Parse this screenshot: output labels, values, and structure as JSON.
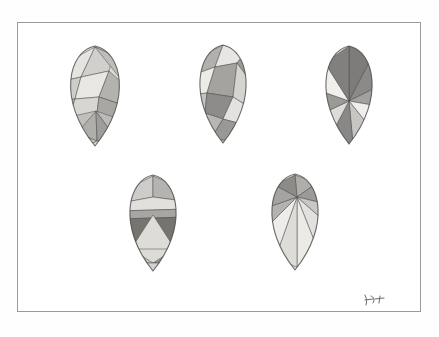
{
  "artwork": {
    "title": "Faceted Eggs Study",
    "medium": "watercolour and graphite on paper",
    "palette": {
      "paper": "#fefefe",
      "frame_line": "#9a9a99",
      "ink_line": "#4a4a4a",
      "tone_lightest": "#efeeec",
      "tone_light": "#dddbd8",
      "tone_mid_light": "#c6c4c1",
      "tone_mid": "#adaba8",
      "tone_mid_dark": "#949290",
      "tone_dark": "#7d7b79",
      "tone_darkest": "#6a6866"
    },
    "frame": {
      "x": 17,
      "y": 22,
      "width": 404,
      "height": 290
    },
    "signature": {
      "label": "artist-signature",
      "text": ""
    },
    "layout": {
      "top_row_count": 3,
      "bottom_row_count": 2,
      "total": 5
    },
    "eggs": [
      {
        "name": "egg-top-left",
        "pattern": "irregular-triangulation",
        "cx": 94,
        "cy": 95,
        "rx": 38,
        "ry": 50,
        "facets": [
          {
            "points": "94,46 72,58 62,80 80,76",
            "tone": "#e6e4e1"
          },
          {
            "points": "94,46 80,76 108,70 112,54",
            "tone": "#d2d0cd"
          },
          {
            "points": "94,46 112,54 124,72 126,86",
            "tone": "#bfbdba"
          },
          {
            "points": "62,80 80,76 74,98 60,100",
            "tone": "#cfcdca"
          },
          {
            "points": "80,76 108,70 98,96 74,98",
            "tone": "#e9e7e4"
          },
          {
            "points": "108,70 126,86 122,104 98,96",
            "tone": "#b4b2af"
          },
          {
            "points": "60,100 74,98 68,116 58,112",
            "tone": "#bdbbb8"
          },
          {
            "points": "74,98 98,96 96,112 68,116",
            "tone": "#d8d6d3"
          },
          {
            "points": "98,96 122,104 124,120 96,112",
            "tone": "#a9a7a4"
          },
          {
            "points": "96,112 95,110 68,116 76,132",
            "tone": "#c2c0bd"
          },
          {
            "points": "95,110 76,132 96,140",
            "tone": "#b0aeab"
          },
          {
            "points": "95,110 96,140 114,136",
            "tone": "#9f9d9a"
          },
          {
            "points": "95,110 114,136 124,120",
            "tone": "#bcbab7"
          },
          {
            "points": "58,112 68,116 76,132 62,128",
            "tone": "#d5d3d0"
          },
          {
            "points": "62,128 76,132 96,140 84,146",
            "tone": "#cac8c5"
          },
          {
            "points": "96,140 114,136 124,120 128,132 112,146 84,146",
            "tone": "#ddd9d6"
          }
        ]
      },
      {
        "name": "egg-top-center",
        "pattern": "bold-angular-planes",
        "cx": 222,
        "cy": 93,
        "rx": 36,
        "ry": 49,
        "facets": [
          {
            "points": "222,44 198,56 192,74 214,66",
            "tone": "#b2b0ad"
          },
          {
            "points": "222,44 214,66 236,62 244,52",
            "tone": "#e8e6e3"
          },
          {
            "points": "244,52 236,62 252,84 256,72",
            "tone": "#9e9c99"
          },
          {
            "points": "192,74 214,66 206,92 190,94",
            "tone": "#edebe8"
          },
          {
            "points": "214,66 236,62 232,96 206,92",
            "tone": "#a5a3a0"
          },
          {
            "points": "236,62 252,84 248,106 232,96",
            "tone": "#d6d4d1"
          },
          {
            "points": "190,94 206,92 204,112 188,110",
            "tone": "#c4c2bf"
          },
          {
            "points": "206,92 232,96 222,118 204,112",
            "tone": "#8e8c8a"
          },
          {
            "points": "232,96 248,106 244,124 222,118",
            "tone": "#e4e2df"
          },
          {
            "points": "188,110 204,112 196,130 186,122",
            "tone": "#f0eeeb"
          },
          {
            "points": "204,112 222,118 210,138 196,130",
            "tone": "#b8b6b3"
          },
          {
            "points": "222,118 244,124 232,140 210,138",
            "tone": "#9a9895"
          },
          {
            "points": "196,130 210,138 232,140 216,142",
            "tone": "#d0cecb"
          },
          {
            "points": "186,122 196,130 216,142 200,140",
            "tone": "#aaa8a5"
          }
        ]
      },
      {
        "name": "egg-top-right",
        "pattern": "radial-pinwheel",
        "cx": 348,
        "cy": 94,
        "rx": 36,
        "ry": 49,
        "center": {
          "x": 348,
          "y": 100
        },
        "facets": [
          {
            "points": "348,100 348,45 372,54",
            "tone": "#7e7c7a"
          },
          {
            "points": "348,100 372,54 384,82",
            "tone": "#8c8a88"
          },
          {
            "points": "348,100 384,82 382,106",
            "tone": "#a3a19e"
          },
          {
            "points": "348,100 382,106 372,130",
            "tone": "#efeeec"
          },
          {
            "points": "348,100 372,130 352,143",
            "tone": "#c8c6c3"
          },
          {
            "points": "348,100 352,143 328,138",
            "tone": "#8a8886"
          },
          {
            "points": "348,100 328,138 314,116",
            "tone": "#dedcd9"
          },
          {
            "points": "348,100 314,116 314,88",
            "tone": "#9b9996"
          },
          {
            "points": "348,100 314,88 324,62",
            "tone": "#f1efec"
          },
          {
            "points": "348,100 324,62 348,45",
            "tone": "#82807e"
          }
        ]
      },
      {
        "name": "egg-bottom-left",
        "pattern": "horizontal-banded-triangles",
        "cx": 152,
        "cy": 222,
        "rx": 36,
        "ry": 48,
        "facets": [
          {
            "points": "152,175 130,186 120,202 152,196",
            "tone": "#ceccc9"
          },
          {
            "points": "152,175 152,196 182,200 174,184",
            "tone": "#b6b4b1"
          },
          {
            "points": "120,202 152,196 182,200 188,208 116,210",
            "tone": "#e2e0dd"
          },
          {
            "points": "116,210 188,208 186,216 118,218",
            "tone": "#a8a6a3"
          },
          {
            "points": "118,218 186,216 188,248 116,246",
            "tone": "#76746f"
          },
          {
            "points": "130,248 152,214 174,248",
            "tone": "#dedcd8"
          },
          {
            "points": "116,246 130,248 122,262",
            "tone": "#8e8c89"
          },
          {
            "points": "130,248 152,262 122,262",
            "tone": "#c5c3c0"
          },
          {
            "points": "152,262 174,248 188,248 182,262",
            "tone": "#9a9895"
          },
          {
            "points": "122,262 152,262 182,262 170,270 134,270",
            "tone": "#d4d2cf"
          }
        ]
      },
      {
        "name": "egg-bottom-right",
        "pattern": "fan-rays-from-apex",
        "cx": 294,
        "cy": 221,
        "rx": 36,
        "ry": 48,
        "apex": {
          "x": 296,
          "y": 196
        },
        "facets": [
          {
            "points": "296,196 294,174 316,182",
            "tone": "#b0aeab"
          },
          {
            "points": "296,196 316,182 330,204",
            "tone": "#9c9a97"
          },
          {
            "points": "296,196 330,204 330,226",
            "tone": "#c9c7c4"
          },
          {
            "points": "296,196 330,226 318,252",
            "tone": "#e3e1de"
          },
          {
            "points": "296,196 318,252 296,266",
            "tone": "#eceae7"
          },
          {
            "points": "296,196 296,266 274,258",
            "tone": "#dedcd9"
          },
          {
            "points": "296,196 274,258 260,232",
            "tone": "#eeecea"
          },
          {
            "points": "296,196 260,232 262,208",
            "tone": "#b4b2af"
          },
          {
            "points": "296,196 262,208 274,184",
            "tone": "#a6a4a1"
          },
          {
            "points": "296,196 274,184 294,174",
            "tone": "#8d8b88"
          }
        ]
      }
    ]
  }
}
